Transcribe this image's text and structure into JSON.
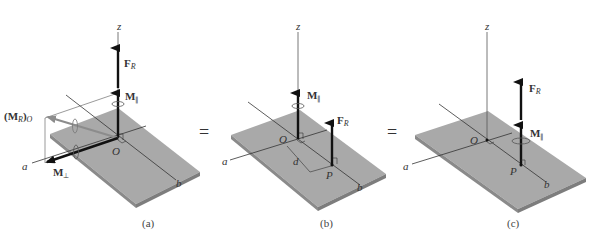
{
  "figure": {
    "panels": [
      {
        "caption": "(a)",
        "labels": {
          "z": "z",
          "force": "F",
          "force_sub": "R",
          "moment_parallel": "M",
          "moment_parallel_sub": "∥",
          "moment_resultant": "(M",
          "moment_resultant_sub": "R",
          "moment_resultant_close": ")",
          "moment_resultant_point": "O",
          "origin": "O",
          "axis_a": "a",
          "axis_b": "b",
          "moment_perp": "M",
          "moment_perp_sub": "⊥"
        }
      },
      {
        "caption": "(b)",
        "labels": {
          "z": "z",
          "moment_parallel": "M",
          "moment_parallel_sub": "∥",
          "force": "F",
          "force_sub": "R",
          "origin": "O",
          "point": "P",
          "distance": "d",
          "axis_a": "a",
          "axis_b": "b"
        }
      },
      {
        "caption": "(c)",
        "labels": {
          "z": "z",
          "force": "F",
          "force_sub": "R",
          "moment_parallel": "M",
          "moment_parallel_sub": "∥",
          "origin": "O",
          "point": "P",
          "axis_a": "a",
          "axis_b": "b"
        }
      }
    ],
    "equals": [
      "=",
      "="
    ],
    "colors": {
      "plate_top": "#a9a9a9",
      "plate_edge": "#8a8a8a",
      "vector": "#111111",
      "resultant_moment": "#8c8c8c",
      "axis_line": "#333333"
    }
  }
}
